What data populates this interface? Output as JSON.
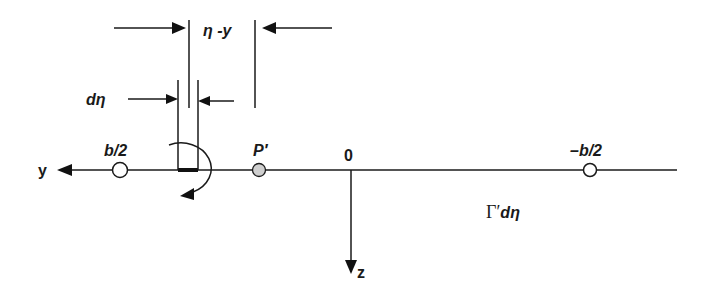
{
  "figure": {
    "type": "horseshoe vortex / lifting line geometry",
    "axes": {
      "y_axis_label": "y",
      "z_axis_label": "z",
      "origin_label": "0"
    },
    "points": [
      {
        "id": "left-tip",
        "label": "b/2",
        "marker": "open-circle"
      },
      {
        "id": "control-point",
        "label": "P′",
        "marker": "gray-filled-circle"
      },
      {
        "id": "right-tip",
        "label": "–b/2",
        "marker": "open-circle"
      }
    ],
    "dimensions": {
      "distance_label_eta": "η",
      "distance_label_sep": " -",
      "distance_label_y": "y",
      "element_width_label_d": "d",
      "element_width_label_eta": "η"
    },
    "vortex_strength": {
      "gamma": "Γ′",
      "d": "d",
      "eta": "η"
    }
  },
  "colors": {
    "stroke": "#1a1a1a",
    "point_fill_gray": "#cfcfcf",
    "background": "#ffffff"
  }
}
